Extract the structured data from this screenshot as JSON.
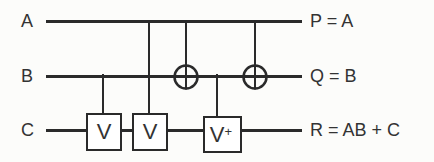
{
  "diagram": {
    "kind": "quantum-circuit",
    "colors": {
      "line": "#2a2a2a",
      "text": "#333333",
      "background": "#fcfcfa",
      "gate_fill": "#ffffff"
    },
    "inputs": [
      {
        "label": "A"
      },
      {
        "label": "B"
      },
      {
        "label": "C"
      }
    ],
    "outputs": [
      {
        "label": "P = A"
      },
      {
        "label": "Q = B"
      },
      {
        "label": "R = AB + C"
      }
    ],
    "gates": [
      {
        "name": "controlled-v-1",
        "label": "V",
        "wire": "C",
        "control": "B"
      },
      {
        "name": "controlled-v-2",
        "label": "V",
        "wire": "C",
        "control": "A"
      },
      {
        "name": "cnot-1",
        "symbol": "xor-target",
        "wire": "B",
        "control": "A"
      },
      {
        "name": "controlled-v-dagger",
        "label": "V",
        "label_sup": "+",
        "wire": "C",
        "control": "B"
      },
      {
        "name": "cnot-2",
        "symbol": "xor-target",
        "wire": "B",
        "control": "A"
      }
    ]
  }
}
